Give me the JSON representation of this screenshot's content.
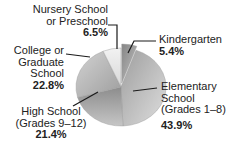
{
  "colors": {
    "background": "#ffffff",
    "text": "#222222",
    "line": "#1a1a1a",
    "slice_stroke": "#9a9a9a"
  },
  "chart_data": {
    "type": "pie",
    "title": "",
    "unit": "%",
    "start_angle_deg": 0,
    "direction": "clockwise",
    "legend_position": "callout-labels",
    "slices": [
      {
        "label": "Kindergarten",
        "value": 5.4,
        "pct_label": "5.4%",
        "exploded": true,
        "color_from": "#858585",
        "color_to": "#c2c2c2",
        "dir": [
          0,
          0,
          1,
          1
        ]
      },
      {
        "label": "Elementary School (Grades 1–8)",
        "value": 43.9,
        "pct_label": "43.9%",
        "exploded": false,
        "color_from": "#9e9e9e",
        "color_to": "#dedede",
        "dir": [
          0,
          0,
          1,
          1
        ]
      },
      {
        "label": "High School (Grades 9–12)",
        "value": 21.4,
        "pct_label": "21.4%",
        "exploded": false,
        "color_from": "#8c8c8c",
        "color_to": "#c6c6c6",
        "dir": [
          0,
          0,
          0,
          1
        ]
      },
      {
        "label": "College or Graduate School",
        "value": 22.8,
        "pct_label": "22.8%",
        "exploded": false,
        "color_from": "#d2d2d2",
        "color_to": "#9e9e9e",
        "dir": [
          0,
          0,
          1,
          1
        ]
      },
      {
        "label": "Nursery School or Preschool",
        "value": 6.5,
        "pct_label": "6.5%",
        "exploded": false,
        "color_from": "#f2f2f2",
        "color_to": "#d8d8d8",
        "dir": [
          0,
          0,
          0,
          1
        ]
      }
    ]
  },
  "labels": {
    "nursery": {
      "line1": "Nursery School",
      "line2": "or Preschool",
      "pct": "6.5%"
    },
    "kindergarten": {
      "line1": "Kindergarten",
      "pct": "5.4%"
    },
    "elementary": {
      "line1": "Elementary",
      "line2": "School",
      "line3": "(Grades 1–8)",
      "pct": "43.9%"
    },
    "high_school": {
      "line1": "High School",
      "line2": "(Grades 9–12)",
      "pct": "21.4%"
    },
    "college": {
      "line1": "College or",
      "line2": "Graduate",
      "line3": "School",
      "pct": "22.8%"
    }
  }
}
